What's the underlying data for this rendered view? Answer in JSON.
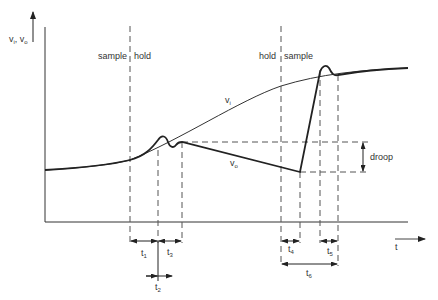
{
  "diagram": {
    "y_axis_label_main": "v",
    "y_axis_sub_i": "i",
    "y_axis_sep": ", v",
    "y_axis_sub_o": "o",
    "x_axis_label": "t",
    "phase_labels": {
      "sample_1": "sample",
      "hold_1": "hold",
      "hold_2": "hold",
      "sample_2": "sample"
    },
    "curve_labels": {
      "vi_main": "v",
      "vi_sub": "i",
      "vo_main": "v",
      "vo_sub": "o"
    },
    "droop_label": "droop",
    "time_labels": [
      {
        "main": "t",
        "sub": "1"
      },
      {
        "main": "t",
        "sub": "2"
      },
      {
        "main": "t",
        "sub": "3"
      },
      {
        "main": "t",
        "sub": "4"
      },
      {
        "main": "t",
        "sub": "5"
      },
      {
        "main": "t",
        "sub": "6"
      }
    ],
    "colors": {
      "line": "#222222",
      "dash": "#555555",
      "text": "#333333"
    }
  }
}
